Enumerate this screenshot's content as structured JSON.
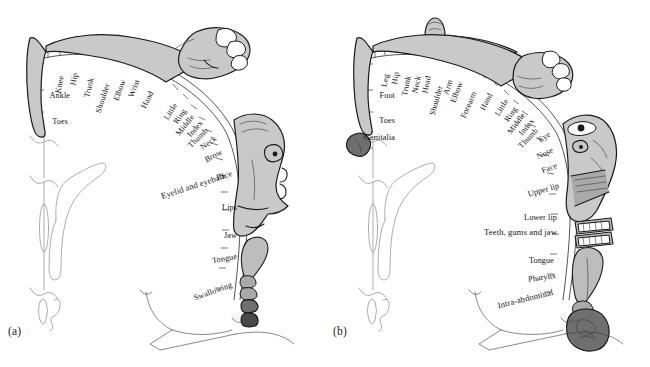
{
  "figure": {
    "colors": {
      "background": "#ffffff",
      "ink": "#1a1a1a",
      "body_fill_light": "#c9c9c9",
      "body_fill_mid": "#a9a9a9",
      "body_fill_dark": "#6f6f6f",
      "body_fill_darkest": "#4a4a4a"
    }
  },
  "panels": [
    {
      "id": "a",
      "caption": "(a)",
      "kind": "motor-homunculus",
      "labels": [
        {
          "text": "Knee",
          "x": 62,
          "y": 76,
          "rot": -78
        },
        {
          "text": "Hip",
          "x": 76,
          "y": 73,
          "rot": -78
        },
        {
          "text": "Trunk",
          "x": 92,
          "y": 78,
          "rot": -76
        },
        {
          "text": "Shoulder",
          "x": 108,
          "y": 84,
          "rot": -72
        },
        {
          "text": "Elbow",
          "x": 124,
          "y": 80,
          "rot": -70
        },
        {
          "text": "Wrist",
          "x": 138,
          "y": 80,
          "rot": -68
        },
        {
          "text": "Hand",
          "x": 152,
          "y": 92,
          "rot": -63
        },
        {
          "text": "Ankle",
          "x": 70,
          "y": 96,
          "rot": 0
        },
        {
          "text": "Toes",
          "x": 68,
          "y": 122,
          "rot": 0
        },
        {
          "text": "Little",
          "x": 176,
          "y": 104,
          "rot": -58
        },
        {
          "text": "Ring",
          "x": 185,
          "y": 110,
          "rot": -56
        },
        {
          "text": "Middle",
          "x": 193,
          "y": 116,
          "rot": -52
        },
        {
          "text": "Index",
          "x": 202,
          "y": 122,
          "rot": -48
        },
        {
          "text": "Thumb",
          "x": 207,
          "y": 130,
          "rot": -44
        },
        {
          "text": "Neck",
          "x": 216,
          "y": 138,
          "rot": -36
        },
        {
          "text": "Brow",
          "x": 222,
          "y": 152,
          "rot": -28
        },
        {
          "text": "Eyelid and eyeball",
          "x": 224,
          "y": 176,
          "rot": -18
        },
        {
          "text": "Face",
          "x": 232,
          "y": 174,
          "rot": -16
        },
        {
          "text": "Lips",
          "x": 237,
          "y": 208,
          "rot": 0
        },
        {
          "text": "Jaw",
          "x": 237,
          "y": 236,
          "rot": 0
        },
        {
          "text": "Tongue",
          "x": 237,
          "y": 257,
          "rot": -10
        },
        {
          "text": "Swallowing",
          "x": 232,
          "y": 285,
          "rot": -20
        }
      ]
    },
    {
      "id": "b",
      "caption": "(b)",
      "kind": "sensory-homunculus",
      "labels": [
        {
          "text": "Leg",
          "x": 62,
          "y": 74,
          "rot": -80
        },
        {
          "text": "Hip",
          "x": 72,
          "y": 72,
          "rot": -80
        },
        {
          "text": "Trunk",
          "x": 84,
          "y": 76,
          "rot": -78
        },
        {
          "text": "Neck",
          "x": 94,
          "y": 76,
          "rot": -78
        },
        {
          "text": "Head",
          "x": 104,
          "y": 76,
          "rot": -78
        },
        {
          "text": "Shoulder",
          "x": 116,
          "y": 86,
          "rot": -74
        },
        {
          "text": "Arm",
          "x": 126,
          "y": 80,
          "rot": -72
        },
        {
          "text": "Elbow",
          "x": 136,
          "y": 82,
          "rot": -70
        },
        {
          "text": "Forearm",
          "x": 150,
          "y": 92,
          "rot": -66
        },
        {
          "text": "Hand",
          "x": 166,
          "y": 94,
          "rot": -62
        },
        {
          "text": "Foot",
          "x": 70,
          "y": 96,
          "rot": 0
        },
        {
          "text": "Toes",
          "x": 70,
          "y": 121,
          "rot": 0
        },
        {
          "text": "Genitalia",
          "x": 70,
          "y": 138,
          "rot": 0
        },
        {
          "text": "Little",
          "x": 182,
          "y": 100,
          "rot": -58
        },
        {
          "text": "Ring",
          "x": 191,
          "y": 108,
          "rot": -56
        },
        {
          "text": "Middle",
          "x": 199,
          "y": 114,
          "rot": -54
        },
        {
          "text": "Index",
          "x": 208,
          "y": 120,
          "rot": -50
        },
        {
          "text": "Thumb",
          "x": 212,
          "y": 130,
          "rot": -46
        },
        {
          "text": "Eye",
          "x": 225,
          "y": 134,
          "rot": -34
        },
        {
          "text": "Nose",
          "x": 228,
          "y": 150,
          "rot": -26
        },
        {
          "text": "Face",
          "x": 232,
          "y": 166,
          "rot": -20
        },
        {
          "text": "Upper lip",
          "x": 234,
          "y": 186,
          "rot": -16
        },
        {
          "text": "Lower lip",
          "x": 232,
          "y": 218,
          "rot": 0
        },
        {
          "text": "Teeth, gums and jaw",
          "x": 232,
          "y": 232,
          "rot": 0
        },
        {
          "text": "Tongue",
          "x": 229,
          "y": 261,
          "rot": 0
        },
        {
          "text": "Pharynx",
          "x": 231,
          "y": 276,
          "rot": -8
        },
        {
          "text": "Intra-abdominal",
          "x": 228,
          "y": 292,
          "rot": -14
        }
      ]
    }
  ]
}
